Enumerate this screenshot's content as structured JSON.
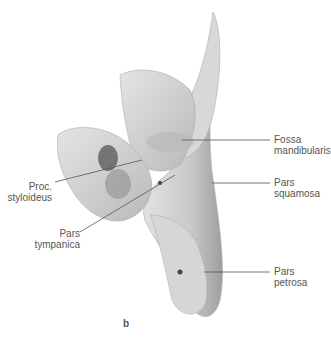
{
  "figure": {
    "subfigure_label": "b",
    "labels": {
      "fossa_mandibularis": [
        "Fossa",
        "mandibularis"
      ],
      "pars_squamosa": [
        "Pars",
        "squamosa"
      ],
      "pars_petrosa": [
        "Pars",
        "petrosa"
      ],
      "proc_styloideus": [
        "Proc.",
        "styloideus"
      ],
      "pars_tympanica": [
        "Pars",
        "tympanica"
      ]
    }
  }
}
